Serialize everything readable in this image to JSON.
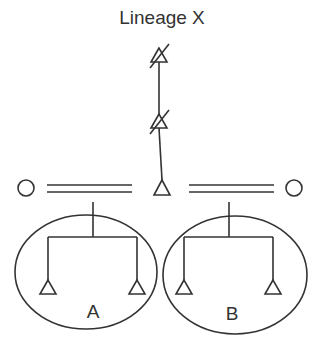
{
  "diagram": {
    "title": "Lineage X",
    "groups": [
      {
        "label": "A"
      },
      {
        "label": "B"
      }
    ],
    "symbols": {
      "lineage_ancestors": "triangle-struck-through (deceased male)",
      "living_male": "triangle",
      "spouses": "circle (female)",
      "marriage": "double-line"
    },
    "caption": ""
  }
}
